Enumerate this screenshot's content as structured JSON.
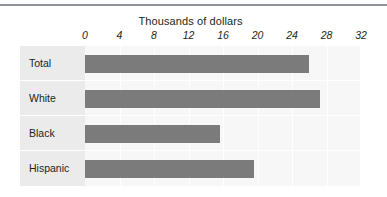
{
  "chart_data": {
    "type": "bar",
    "orientation": "horizontal",
    "title": "Thousands of dollars",
    "xlabel": "",
    "ylabel": "",
    "categories": [
      "Total",
      "White",
      "Black",
      "Hispanic"
    ],
    "values": [
      26.0,
      27.2,
      15.6,
      19.6
    ],
    "xticks": [
      0,
      4,
      8,
      12,
      16,
      20,
      24,
      28,
      32
    ],
    "xlim": [
      0,
      32
    ],
    "grid": true,
    "legend": false,
    "bar_color": "#7b7b7b",
    "plot_background": "#f7f7f7",
    "label_background": "#ebebeb",
    "gridline_color": "#ffffff",
    "text_color": "#231f20",
    "rule_color": "#8d9299"
  }
}
